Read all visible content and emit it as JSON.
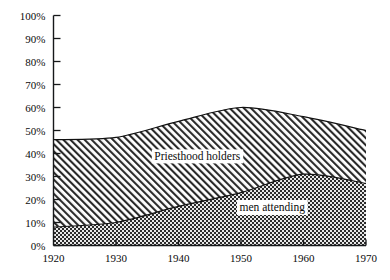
{
  "chart_data": {
    "type": "area",
    "title": "",
    "subtitle": "",
    "xlabel": "",
    "ylabel": "",
    "x": [
      1920,
      1930,
      1940,
      1950,
      1960,
      1970
    ],
    "xticklabels": [
      "1920",
      "1930",
      "1940",
      "1950",
      "1960",
      "1970"
    ],
    "yticklabels": [
      "0%",
      "10%",
      "20%",
      "30%",
      "40%",
      "50%",
      "60%",
      "70%",
      "80%",
      "90%",
      "100%"
    ],
    "ytickvalues": [
      0,
      10,
      20,
      30,
      40,
      50,
      60,
      70,
      80,
      90,
      100
    ],
    "xlim": [
      1920,
      1970
    ],
    "ylim": [
      0,
      100
    ],
    "grid": false,
    "legend_position": "inline-annotation",
    "stacked": false,
    "series": [
      {
        "name": "Priesthood holders",
        "values": [
          46,
          47,
          54,
          60,
          56,
          50
        ],
        "fill": "diagonal-hatch",
        "annotation": "Priesthood holders"
      },
      {
        "name": "men attending",
        "values": [
          8,
          10,
          17,
          23,
          31,
          27
        ],
        "fill": "dense-checker",
        "annotation": "men attending"
      }
    ],
    "annotations": [
      {
        "text": "Priesthood holders",
        "x": 1943,
        "y": 37
      },
      {
        "text": "men attending",
        "x": 1955,
        "y": 15
      }
    ]
  },
  "axes": {
    "y_ticks": [
      "100%",
      "90%",
      "80%",
      "70%",
      "60%",
      "50%",
      "40%",
      "30%",
      "20%",
      "10%",
      "0%"
    ],
    "x_ticks": [
      "1920",
      "1930",
      "1940",
      "1950",
      "1960",
      "1970"
    ]
  },
  "colors": {
    "axis": "#16181a",
    "text": "#0b0b0b",
    "upper_band": "#d9d9d9",
    "lower_band": "#3a3a3a",
    "background": "#ffffff"
  }
}
